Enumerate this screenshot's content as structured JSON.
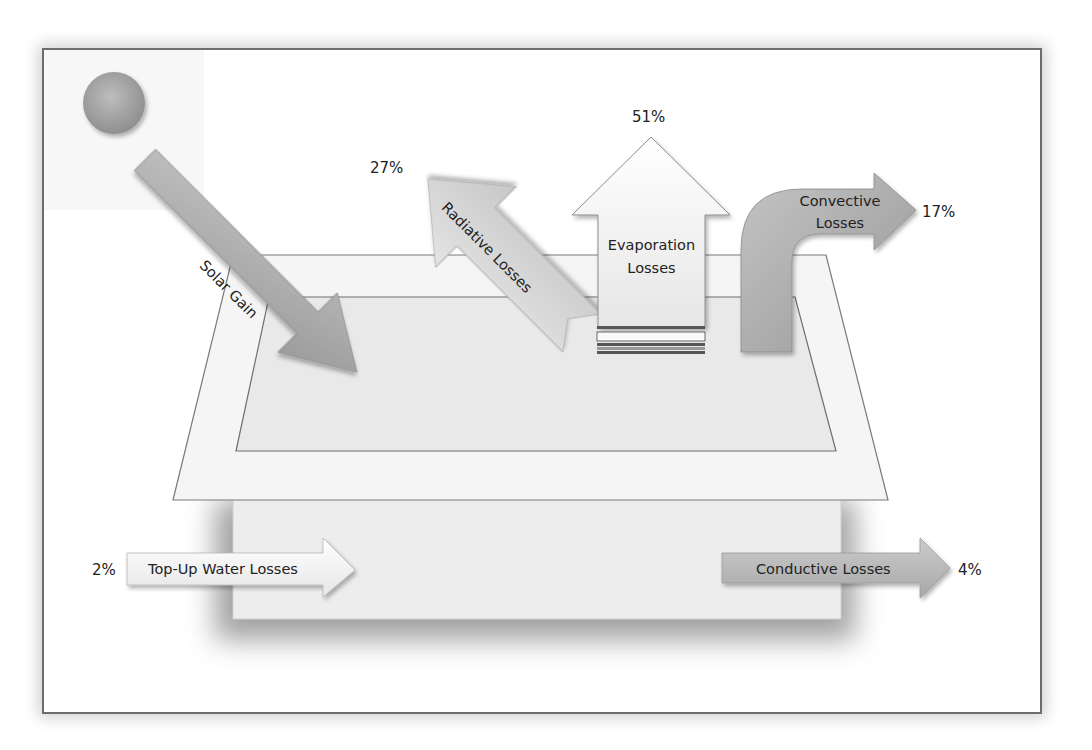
{
  "diagram": {
    "title": "",
    "colors": {
      "frame_border": "#6d6d6d",
      "arrow_gray": "#a9a9a9",
      "arrow_light": "#d8d8d8",
      "arrow_white": "#f4f4f4",
      "pool": "#ececec",
      "text": "#222222"
    },
    "sun": {
      "icon": "sun-circle-icon"
    },
    "arrows": {
      "solar_gain": {
        "label": "Solar Gain",
        "direction": "in"
      },
      "radiative": {
        "label": "Radiative Losses",
        "percent": "27%"
      },
      "evaporation": {
        "label_line1": "Evaporation",
        "label_line2": "Losses",
        "percent": "51%"
      },
      "convective": {
        "label_line1": "Convective",
        "label_line2": "Losses",
        "percent": "17%"
      },
      "top_up": {
        "label": "Top-Up Water Losses",
        "percent": "2%"
      },
      "conductive": {
        "label": "Conductive Losses",
        "percent": "4%"
      }
    }
  }
}
